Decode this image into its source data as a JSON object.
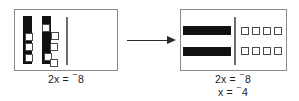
{
  "figure": {
    "transform_arrow": "right-arrow",
    "colors": {
      "bar_fill": "#111111",
      "unit_border": "#4a4a4a",
      "panel_border": "#8a8a8a",
      "divider": "#6e6e6e",
      "arrow": "#2a2a2a",
      "background": "#ffffff",
      "text": "#1b1b1b"
    }
  },
  "panels": [
    {
      "id": "before",
      "name": "before-panel",
      "variable_bars": {
        "count": 2,
        "orientation": "vertical",
        "meaning": "2x"
      },
      "unit_tiles": {
        "count": 8,
        "arrangement": "scattered",
        "meaning": "negative 8"
      },
      "caption": {
        "lines": [
          {
            "prefix": "2x = ",
            "sign": "⁻",
            "value": "8",
            "text": "2x = ⁻8"
          }
        ]
      }
    },
    {
      "id": "after",
      "name": "after-panel",
      "variable_bars": {
        "count": 2,
        "orientation": "horizontal",
        "meaning": "2x"
      },
      "unit_tiles": {
        "count": 8,
        "arrangement": "two-rows-of-four",
        "rows": 2,
        "columns": 4,
        "meaning": "negative 8"
      },
      "caption": {
        "lines": [
          {
            "prefix": "2x = ",
            "sign": "⁻",
            "value": "8",
            "text": "2x = ⁻8"
          },
          {
            "prefix": "x = ",
            "sign": "⁻",
            "value": "4",
            "text": "x = ⁻4"
          }
        ]
      }
    }
  ],
  "captions": {
    "before_line1_prefix": "2x = ",
    "before_line1_sign": "⁻",
    "before_line1_value": "8",
    "after_line1_prefix": "2x = ",
    "after_line1_sign": "⁻",
    "after_line1_value": "8",
    "after_line2_prefix": "x = ",
    "after_line2_sign": "⁻",
    "after_line2_value": "4"
  }
}
